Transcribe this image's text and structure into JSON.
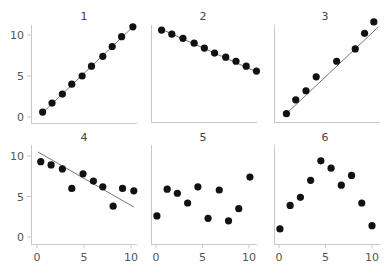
{
  "chart_data": [
    {
      "type": "scatter",
      "title": "1",
      "xlim": [
        0,
        10
      ],
      "ylim": [
        0,
        10
      ],
      "x": [
        0.6,
        1.6,
        2.7,
        3.7,
        4.8,
        5.8,
        7.0,
        8.0,
        9.0,
        10.2
      ],
      "y": [
        0.6,
        1.7,
        2.8,
        4.0,
        5.0,
        6.2,
        7.4,
        8.6,
        9.8,
        11.0
      ],
      "fit_line": [
        [
          0.4,
          0.3
        ],
        [
          10.3,
          11.1
        ]
      ],
      "show_yticks": true,
      "show_xticks": false
    },
    {
      "type": "scatter",
      "title": "2",
      "xlim": [
        0,
        10
      ],
      "ylim": [
        0,
        10
      ],
      "x": [
        0.6,
        1.7,
        2.9,
        4.1,
        5.2,
        6.3,
        7.5,
        8.6,
        9.7,
        10.8
      ],
      "y": [
        10.6,
        10.1,
        9.6,
        9.0,
        8.4,
        7.8,
        7.3,
        6.8,
        6.2,
        5.6
      ],
      "fit_line": [
        [
          0.4,
          10.8
        ],
        [
          11.0,
          5.4
        ]
      ],
      "show_yticks": false,
      "show_xticks": false
    },
    {
      "type": "scatter",
      "title": "3",
      "xlim": [
        0,
        10
      ],
      "ylim": [
        0,
        10
      ],
      "x": [
        0.8,
        1.8,
        2.9,
        4.0,
        6.2,
        8.2,
        9.2,
        10.2
      ],
      "y": [
        0.4,
        2.1,
        3.2,
        4.9,
        6.8,
        8.3,
        10.2,
        11.6
      ],
      "fit_line": [
        [
          0.6,
          0.2
        ],
        [
          10.7,
          11.0
        ]
      ],
      "show_yticks": false,
      "show_xticks": false
    },
    {
      "type": "scatter",
      "title": "4",
      "xlim": [
        0,
        10
      ],
      "ylim": [
        0,
        10
      ],
      "x": [
        0.4,
        1.5,
        2.7,
        3.7,
        4.9,
        6.0,
        7.0,
        8.1,
        9.1,
        10.3
      ],
      "y": [
        9.3,
        8.9,
        8.4,
        6.0,
        7.8,
        6.9,
        6.2,
        3.8,
        6.0,
        5.7
      ],
      "fit_line": [
        [
          0.1,
          10.5
        ],
        [
          10.3,
          3.7
        ]
      ],
      "show_yticks": true,
      "show_xticks": true
    },
    {
      "type": "scatter",
      "title": "5",
      "xlim": [
        0,
        10
      ],
      "ylim": [
        0,
        10
      ],
      "x": [
        0.1,
        1.2,
        2.3,
        3.4,
        4.5,
        5.6,
        6.8,
        7.8,
        8.9,
        10.1
      ],
      "y": [
        2.6,
        5.9,
        5.4,
        4.2,
        6.2,
        2.3,
        5.8,
        2.0,
        3.5,
        7.4
      ],
      "fit_line": null,
      "show_yticks": false,
      "show_xticks": true
    },
    {
      "type": "scatter",
      "title": "6",
      "xlim": [
        0,
        10
      ],
      "ylim": [
        0,
        10
      ],
      "x": [
        0.1,
        1.2,
        2.3,
        3.4,
        4.5,
        5.6,
        6.7,
        7.8,
        8.9,
        10.0
      ],
      "y": [
        1.0,
        3.9,
        4.9,
        7.0,
        9.4,
        8.5,
        6.4,
        7.6,
        4.2,
        1.4
      ],
      "fit_line": null,
      "show_yticks": false,
      "show_xticks": true
    }
  ],
  "axes": {
    "yticks": [
      0,
      5,
      10
    ],
    "xticks": [
      0,
      5,
      10
    ],
    "ytick_labels": [
      "0",
      "5",
      "10"
    ],
    "xtick_labels": [
      "0",
      "5",
      "10"
    ]
  },
  "colors": {
    "point": "#111111",
    "fit_line": "#777777",
    "axis": "#c8c8c8",
    "tick_label": "#555555"
  }
}
